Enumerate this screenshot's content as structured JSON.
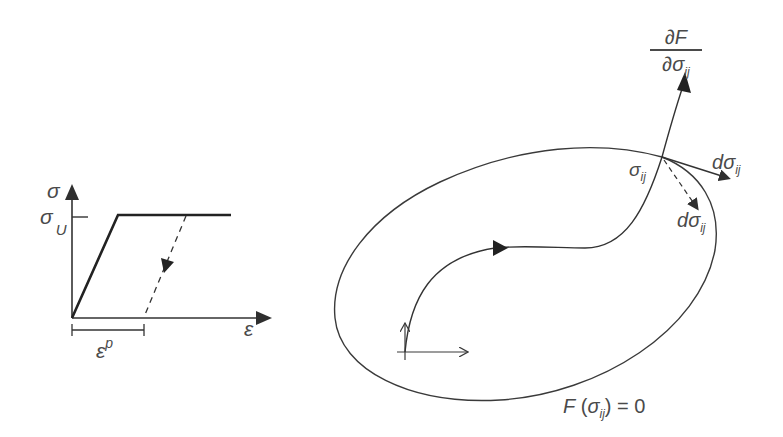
{
  "figure": {
    "stroke_color": "#3a3a3a",
    "label_color": "#4a4a4a",
    "background": "#ffffff"
  },
  "stress_strain_plot": {
    "y_axis_label": "σ",
    "x_axis_label": "ε",
    "yield_level_label": {
      "base": "σ",
      "sub": "U"
    },
    "plastic_strain_label": {
      "base": "ε",
      "sup": "p"
    },
    "curve": "elastic-perfectly-plastic",
    "unloading_path": "dashed, parallel to elastic slope"
  },
  "yield_surface_plot": {
    "gradient_label": {
      "numerator": "∂F",
      "denominator_base": "∂σ",
      "denominator_sub": "ij"
    },
    "stress_point_label": {
      "base": "σ",
      "sub": "ij"
    },
    "tangent_increment_label": {
      "prefix": "d",
      "base": "σ",
      "sub": "ij"
    },
    "inward_increment_label": {
      "prefix": "d",
      "base": "σ",
      "sub": "ij"
    },
    "surface_equation": {
      "func": "F",
      "open": " (",
      "base": "σ",
      "sub": "ij",
      "close": ")",
      "rhs": " = 0"
    }
  }
}
